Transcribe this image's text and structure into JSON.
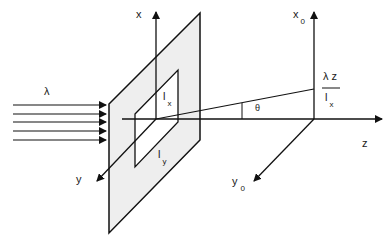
{
  "diagram": {
    "labels": {
      "lambda": "λ",
      "x_axis": "x",
      "y_axis": "y",
      "z_axis": "z",
      "x0_main": "x",
      "x0_sub": "0",
      "y0_main": "y",
      "y0_sub": "0",
      "lx_main": "l",
      "lx_sub": "x",
      "ly_main": "l",
      "ly_sub": "y",
      "angle": "θ",
      "fraction_numerator": "λ  z",
      "fraction_den_main": "l",
      "fraction_den_sub": "x"
    },
    "colors": {
      "line": "#111111",
      "plate_fill": "#eeeeee",
      "background": "#ffffff"
    }
  }
}
